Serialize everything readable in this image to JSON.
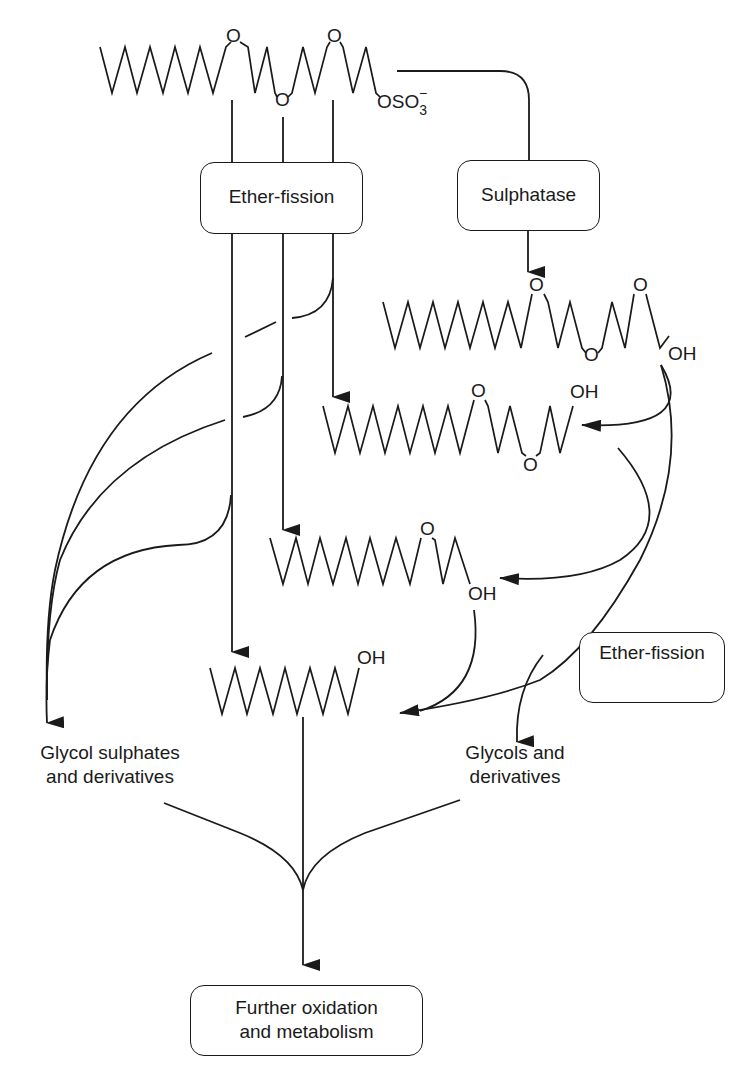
{
  "diagram": {
    "type": "metabolic-pathway",
    "molecules": {
      "start": {
        "atoms": [
          "O",
          "O",
          "O"
        ],
        "terminal": "OSO",
        "terminal_sub": "3",
        "terminal_charge": "−"
      },
      "desulphated": {
        "atoms": [
          "O",
          "O",
          "O"
        ],
        "terminal": "OH"
      },
      "one_ether_removed": {
        "atoms": [
          "O",
          "O"
        ],
        "terminal": "OH"
      },
      "two_ether_removed": {
        "atoms": [
          "O"
        ],
        "terminal": "OH"
      },
      "alcohol": {
        "terminal": "OH"
      }
    },
    "boxes": {
      "ether_fission_top": "Ether-fission",
      "sulphatase": "Sulphatase",
      "ether_fission_right": "Ether-fission",
      "final_line1": "Further oxidation",
      "final_line2": "and metabolism"
    },
    "labels": {
      "glycol_sulphates_line1": "Glycol sulphates",
      "glycol_sulphates_line2": "and derivatives",
      "glycols_line1": "Glycols and",
      "glycols_line2": "derivatives"
    }
  }
}
